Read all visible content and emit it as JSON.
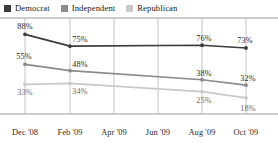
{
  "chart_data": {
    "type": "line",
    "title": "",
    "subtitle": "",
    "xlabel": "",
    "ylabel": "",
    "grid": "vertical",
    "legend_position": "top-left",
    "ylim": [
      0,
      100
    ],
    "categories": [
      "Dec '08",
      "Feb '09",
      "Apr '09",
      "Jun '09",
      "Aug '09",
      "Oct '09"
    ],
    "series": [
      {
        "name": "Democrat",
        "color": "#3c3c3c",
        "points": [
          {
            "x": "Dec '08",
            "value": 88,
            "label": "88%"
          },
          {
            "x": "Feb '09",
            "value": 75,
            "label": "75%"
          },
          {
            "x": "Aug '09",
            "value": 76,
            "label": "76%"
          },
          {
            "x": "Oct '09",
            "value": 73,
            "label": "73%"
          }
        ]
      },
      {
        "name": "Independent",
        "color": "#8b8b8b",
        "points": [
          {
            "x": "Dec '08",
            "value": 55,
            "label": "55%"
          },
          {
            "x": "Feb '09",
            "value": 48,
            "label": "48%"
          },
          {
            "x": "Aug '09",
            "value": 38,
            "label": "38%"
          },
          {
            "x": "Oct '09",
            "value": 32,
            "label": "32%"
          }
        ]
      },
      {
        "name": "Republican",
        "color": "#c9c9c9",
        "points": [
          {
            "x": "Dec '08",
            "value": 33,
            "label": "33%"
          },
          {
            "x": "Feb '09",
            "value": 34,
            "label": "34%"
          },
          {
            "x": "Aug '09",
            "value": 25,
            "label": "25%"
          },
          {
            "x": "Oct '09",
            "value": 18,
            "label": "18%"
          }
        ]
      }
    ]
  },
  "legend": {
    "items": [
      {
        "label": "Democrat",
        "color": "#3c3c3c"
      },
      {
        "label": "Independent",
        "color": "#8b8b8b"
      },
      {
        "label": "Republican",
        "color": "#c9c9c9"
      }
    ]
  },
  "axis": {
    "x_ticks": [
      "Dec '08",
      "Feb '09",
      "Apr '09",
      "Jun '09",
      "Aug '09",
      "Oct '09"
    ]
  },
  "style": {
    "frame_color": "#9a9a9a",
    "gridline_color": "#c4c4c4",
    "background": "#ffffff"
  }
}
